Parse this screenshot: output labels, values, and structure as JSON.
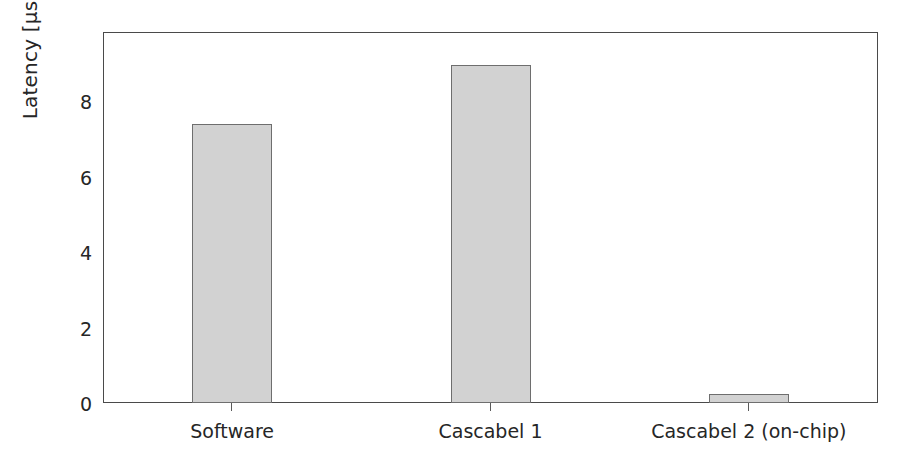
{
  "chart_data": {
    "type": "bar",
    "title": "",
    "xlabel": "",
    "ylabel": "Latency [μs]",
    "categories": [
      "Software",
      "Cascabel 1",
      "Cascabel 2 (on-chip)"
    ],
    "values": [
      7.4,
      8.95,
      0.25
    ],
    "ylim": [
      0,
      9.83
    ],
    "xlim": [
      0,
      3
    ],
    "yticks": [
      0,
      2,
      4,
      6,
      8
    ],
    "ytick_labels": [
      "0",
      "2",
      "4",
      "6",
      "8"
    ],
    "grid": false,
    "legend": null,
    "bar_fill_color": "#d2d2d2",
    "bar_edge_color": "#6e6e6e",
    "axis_color": "#4a4a4a",
    "text_color": "#262626",
    "background_color": "#ffffff"
  },
  "axes": {
    "y_title": "Latency [μs]"
  }
}
